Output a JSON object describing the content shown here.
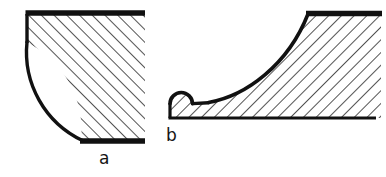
{
  "plate": {
    "name": "sectioned-fillet-figures",
    "background_color": "#ffffff",
    "line_color": "#111111",
    "hatch_color": "#1a1a1a",
    "width": 386,
    "height": 177
  },
  "figures": [
    {
      "id": "a",
      "label": "a",
      "name": "concave-quarter-round-fillet",
      "hatch_direction": "positive-slope",
      "hatch_angle_deg": 45,
      "hatch_spacing_px": 9,
      "outline": {
        "top_edge": {
          "x1": 26,
          "y1": 13,
          "x2": 145,
          "y2": 13,
          "thickness": 5
        },
        "left_stub": {
          "x1": 26,
          "y1": 13,
          "x2": 26,
          "y2": 42,
          "thickness": 4
        },
        "concave_arc": {
          "start_x": 26,
          "start_y": 42,
          "end_x": 82,
          "end_y": 140,
          "radius": 98
        },
        "bottom_edge": {
          "x1": 80,
          "y1": 141,
          "x2": 145,
          "y2": 141,
          "thickness": 5
        }
      }
    },
    {
      "id": "b",
      "label": "b",
      "name": "ogee-curve-with-convex-bead",
      "hatch_direction": "negative-slope",
      "hatch_angle_deg": -45,
      "hatch_spacing_px": 9,
      "outline": {
        "top_edge": {
          "x1": 306,
          "y1": 13,
          "x2": 381,
          "y2": 13,
          "thickness": 5
        },
        "concave_sweep": {
          "start_x": 308,
          "start_y": 15,
          "end_x": 208,
          "end_y": 103
        },
        "flat_run": {
          "x1": 208,
          "y1": 103,
          "x2": 192,
          "y2": 104
        },
        "convex_bead": {
          "center_x": 181,
          "center_y": 104,
          "radius": 11
        },
        "left_face": {
          "x1": 170,
          "y1": 104,
          "x2": 170,
          "y2": 118,
          "thickness": 3
        },
        "bottom_edge": {
          "x1": 169,
          "y1": 118,
          "x2": 376,
          "y2": 118,
          "thickness": 3
        }
      }
    }
  ]
}
